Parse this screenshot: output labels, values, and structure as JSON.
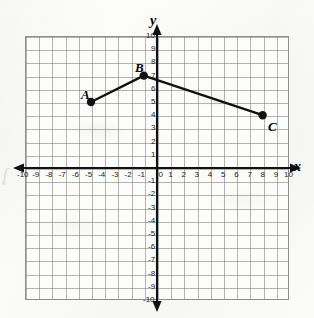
{
  "figure": {
    "kind": "coordinate-plane-graph",
    "edge_artifact_glyph": "ʆ"
  },
  "axes": {
    "x_name": "x",
    "y_name": "y",
    "x_ticks_negative": [
      "-10",
      "-9",
      "-8",
      "-7",
      "-6",
      "-5",
      "-4",
      "-3",
      "-2",
      "-1"
    ],
    "origin_label": "0",
    "x_ticks_positive": [
      "1",
      "2",
      "3",
      "4",
      "5",
      "6",
      "7",
      "8",
      "9",
      "10"
    ],
    "y_ticks_positive": [
      "1",
      "2",
      "3",
      "4",
      "5",
      "6",
      "7",
      "8",
      "9",
      "10"
    ],
    "y_ticks_negative": [
      "-1",
      "-2",
      "-3",
      "-4",
      "-5",
      "-6",
      "-7",
      "-8",
      "-9",
      "-10"
    ]
  },
  "chart_data": {
    "type": "line",
    "title": "",
    "xlabel": "x",
    "ylabel": "y",
    "xlim": [
      -10,
      10
    ],
    "ylim": [
      -10,
      10
    ],
    "grid": true,
    "grid_step": 1,
    "legend": "none",
    "series": [
      {
        "name": "polyline ABC",
        "x": [
          -5,
          -1,
          8
        ],
        "y": [
          5,
          7,
          4
        ]
      }
    ],
    "points": [
      {
        "label": "A",
        "x": -5,
        "y": 5,
        "label_position": "above-left"
      },
      {
        "label": "B",
        "x": -1,
        "y": 7,
        "label_position": "above-left"
      },
      {
        "label": "C",
        "x": 8,
        "y": 4,
        "label_position": "below-right"
      }
    ],
    "colors": {
      "line": "#111111",
      "point": "#111111",
      "axis": "#111111",
      "grid": "#787878",
      "paper": "#fbfbf9"
    }
  }
}
